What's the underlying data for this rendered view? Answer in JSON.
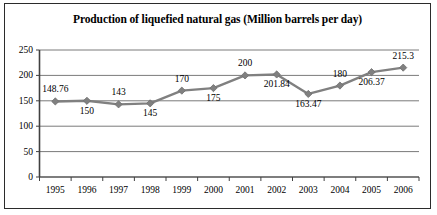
{
  "chart_data": {
    "type": "line",
    "title": "Production of liquefied natural gas (Million barrels per day)",
    "xlabel": "",
    "ylabel": "",
    "categories": [
      "1995",
      "1996",
      "1997",
      "1998",
      "1999",
      "2000",
      "2001",
      "2002",
      "2003",
      "2004",
      "2005",
      "2006"
    ],
    "values": [
      148.76,
      150,
      143,
      145,
      170,
      175,
      200,
      201.84,
      163.47,
      180,
      206.37,
      215.3
    ],
    "point_labels": [
      "148.76",
      "150",
      "143",
      "145",
      "170",
      "175",
      "200",
      "201.84",
      "163.47",
      "180",
      "206.37",
      "215.3"
    ],
    "label_positions": [
      "above",
      "below",
      "above",
      "below",
      "above",
      "below",
      "above",
      "below",
      "below",
      "above",
      "below",
      "above"
    ],
    "ylim": [
      0,
      250
    ],
    "yticks": [
      0,
      50,
      100,
      150,
      200,
      250
    ],
    "ytick_labels": [
      "0",
      "50",
      "100",
      "150",
      "200",
      "250"
    ],
    "grid": true,
    "legend": false,
    "series_color": "#808080",
    "marker": "diamond",
    "gridline_color": "#7a7a7a",
    "axis_color": "#404040",
    "border_color": "#2b2b2b"
  }
}
